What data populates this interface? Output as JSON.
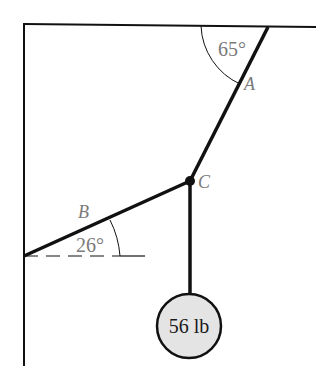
{
  "diagram": {
    "type": "statics-free-body",
    "labels": {
      "angle_a": "65°",
      "rope_a": "A",
      "rope_b": "B",
      "angle_b": "26°",
      "joint_c": "C",
      "weight": "56 lb"
    },
    "geometry": {
      "angle_a_deg": 65,
      "angle_b_deg": 26,
      "weight_lb": 56
    },
    "colors": {
      "line": "#111111",
      "label": "#7a7a7a",
      "weight_fill": "#e4e4e4"
    }
  }
}
